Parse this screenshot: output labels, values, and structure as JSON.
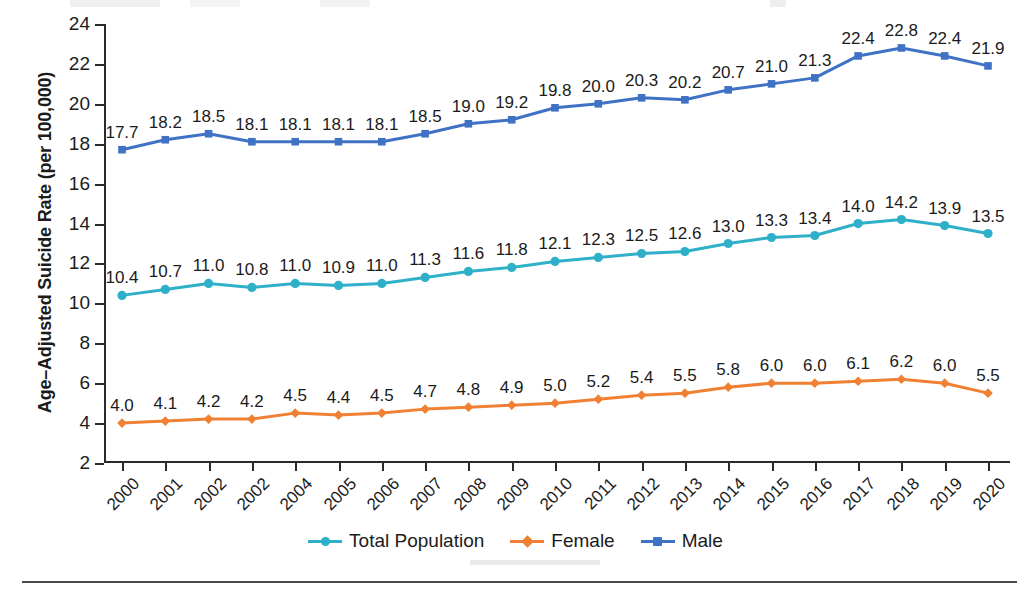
{
  "chart_data": {
    "type": "line",
    "title": "",
    "xlabel": "",
    "ylabel": "Age–Adjusted Suicide Rate (per 100,000)",
    "categories": [
      "2000",
      "2001",
      "2002",
      "2002",
      "2004",
      "2005",
      "2006",
      "2007",
      "2008",
      "2009",
      "2010",
      "2011",
      "2012",
      "2013",
      "2014",
      "2015",
      "2016",
      "2017",
      "2018",
      "2019",
      "2020"
    ],
    "ylim": [
      2,
      24
    ],
    "yticks": [
      2,
      4,
      6,
      8,
      10,
      12,
      14,
      16,
      18,
      20,
      22,
      24
    ],
    "grid": false,
    "legend_position": "bottom",
    "series": [
      {
        "name": "Total Population",
        "color": "#2eb0c8",
        "marker": "circle",
        "values": [
          10.4,
          10.7,
          11.0,
          10.8,
          11.0,
          10.9,
          11.0,
          11.3,
          11.6,
          11.8,
          12.1,
          12.3,
          12.5,
          12.6,
          13.0,
          13.3,
          13.4,
          14.0,
          14.2,
          13.9,
          13.5
        ],
        "labels": [
          "10.4",
          "10.7",
          "11.0",
          "10.8",
          "11.0",
          "10.9",
          "11.0",
          "11.3",
          "11.6",
          "11.8",
          "12.1",
          "12.3",
          "12.5",
          "12.6",
          "13.0",
          "13.3",
          "13.4",
          "14.0",
          "14.2",
          "13.9",
          "13.5"
        ]
      },
      {
        "name": "Female",
        "color": "#f08033",
        "marker": "diamond",
        "values": [
          4.0,
          4.1,
          4.2,
          4.2,
          4.5,
          4.4,
          4.5,
          4.7,
          4.8,
          4.9,
          5.0,
          5.2,
          5.4,
          5.5,
          5.8,
          6.0,
          6.0,
          6.1,
          6.2,
          6.0,
          5.5
        ],
        "labels": [
          "4.0",
          "4.1",
          "4.2",
          "4.2",
          "4.5",
          "4.4",
          "4.5",
          "4.7",
          "4.8",
          "4.9",
          "5.0",
          "5.2",
          "5.4",
          "5.5",
          "5.8",
          "6.0",
          "6.0",
          "6.1",
          "6.2",
          "6.0",
          "5.5"
        ]
      },
      {
        "name": "Male",
        "color": "#3f72c4",
        "marker": "square",
        "values": [
          17.7,
          18.2,
          18.5,
          18.1,
          18.1,
          18.1,
          18.1,
          18.5,
          19.0,
          19.2,
          19.8,
          20.0,
          20.3,
          20.2,
          20.7,
          21.0,
          21.3,
          22.4,
          22.8,
          22.4,
          21.9
        ],
        "labels": [
          "17.7",
          "18.2",
          "18.5",
          "18.1",
          "18.1",
          "18.1",
          "18.1",
          "18.5",
          "19.0",
          "19.2",
          "19.8",
          "20.0",
          "20.3",
          "20.2",
          "20.7",
          "21.0",
          "21.3",
          "22.4",
          "22.8",
          "22.4",
          "21.9"
        ]
      }
    ]
  },
  "legend": {
    "items": [
      {
        "label": "Total Population"
      },
      {
        "label": "Female"
      },
      {
        "label": "Male"
      }
    ]
  }
}
